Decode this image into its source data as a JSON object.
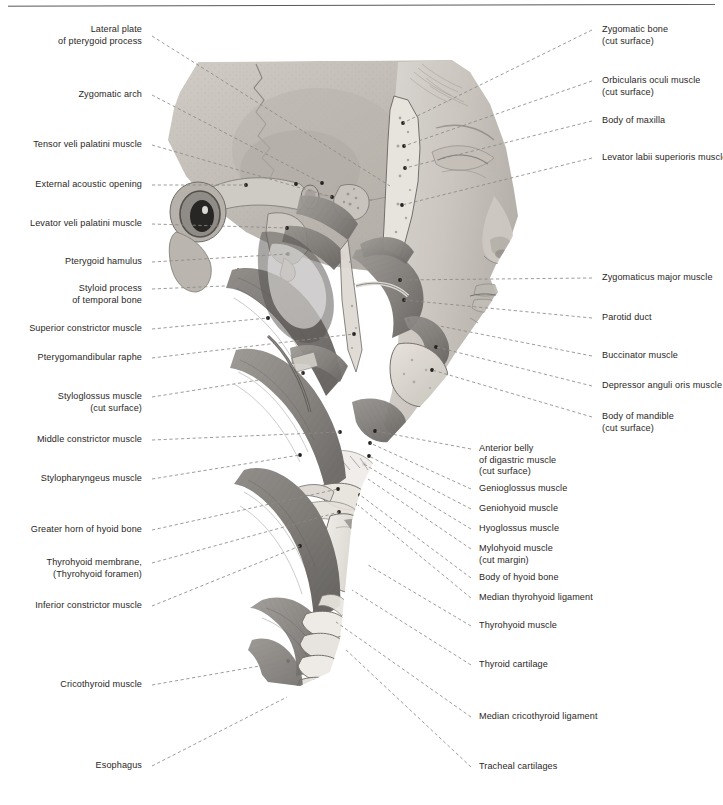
{
  "figure": {
    "style": "grayscale halftone anatomical illustration",
    "background_color": "#ffffff",
    "label_color": "#2b2726",
    "leader_color": "#8d8a87"
  },
  "labels_left": [
    {
      "id": "lateral-plate-of-pterygoid-process",
      "lines": [
        "Lateral plate",
        "of pterygoid process"
      ],
      "text_right_x": 142,
      "text_top_y": 24,
      "anchor_x": 152,
      "anchor_y": 36,
      "target_x": 390,
      "target_y": 186
    },
    {
      "id": "zygomatic-arch",
      "lines": [
        "Zygomatic arch"
      ],
      "text_right_x": 142,
      "text_top_y": 89,
      "anchor_x": 152,
      "anchor_y": 95,
      "target_x": 322,
      "target_y": 183
    },
    {
      "id": "tensor-veli-palatini-muscle",
      "lines": [
        "Tensor veli palatini muscle"
      ],
      "text_right_x": 142,
      "text_top_y": 139,
      "anchor_x": 152,
      "anchor_y": 145,
      "target_x": 332,
      "target_y": 197
    },
    {
      "id": "external-acoustic-opening",
      "lines": [
        "External acoustic opening"
      ],
      "text_right_x": 142,
      "text_top_y": 179,
      "anchor_x": 152,
      "anchor_y": 185,
      "target_x": 246,
      "target_y": 185
    },
    {
      "id": "levator-veli-palatini-muscle",
      "lines": [
        "Levator veli palatini muscle"
      ],
      "text_right_x": 142,
      "text_top_y": 218,
      "anchor_x": 152,
      "anchor_y": 224,
      "target_x": 287,
      "target_y": 228
    },
    {
      "id": "pterygoid-hamulus",
      "lines": [
        "Pterygoid hamulus"
      ],
      "text_right_x": 142,
      "text_top_y": 256,
      "anchor_x": 152,
      "anchor_y": 262,
      "target_x": 288,
      "target_y": 254
    },
    {
      "id": "styloid-process-of-temporal-bone",
      "lines": [
        "Styloid process",
        "of temporal bone"
      ],
      "text_right_x": 142,
      "text_top_y": 283,
      "anchor_x": 152,
      "anchor_y": 289,
      "target_x": 248,
      "target_y": 285
    },
    {
      "id": "superior-constrictor-muscle",
      "lines": [
        "Superior constrictor muscle"
      ],
      "text_right_x": 142,
      "text_top_y": 323,
      "anchor_x": 152,
      "anchor_y": 329,
      "target_x": 268,
      "target_y": 318
    },
    {
      "id": "pterygomandibular-raphe",
      "lines": [
        "Pterygomandibular raphe"
      ],
      "text_right_x": 142,
      "text_top_y": 352,
      "anchor_x": 152,
      "anchor_y": 358,
      "target_x": 354,
      "target_y": 334
    },
    {
      "id": "styloglossus-muscle",
      "lines": [
        "Styloglossus muscle",
        "(cut surface)"
      ],
      "text_right_x": 142,
      "text_top_y": 391,
      "anchor_x": 152,
      "anchor_y": 397,
      "target_x": 303,
      "target_y": 373
    },
    {
      "id": "middle-constrictor-muscle",
      "lines": [
        "Middle constrictor muscle"
      ],
      "text_right_x": 142,
      "text_top_y": 434,
      "anchor_x": 152,
      "anchor_y": 440,
      "target_x": 340,
      "target_y": 432
    },
    {
      "id": "stylopharyngeus-muscle",
      "lines": [
        "Stylopharyngeus muscle"
      ],
      "text_right_x": 142,
      "text_top_y": 473,
      "anchor_x": 152,
      "anchor_y": 479,
      "target_x": 300,
      "target_y": 455
    },
    {
      "id": "greater-horn-of-hyoid-bone",
      "lines": [
        "Greater horn of hyoid bone"
      ],
      "text_right_x": 142,
      "text_top_y": 524,
      "anchor_x": 152,
      "anchor_y": 530,
      "target_x": 338,
      "target_y": 489
    },
    {
      "id": "thyrohyoid-membrane-foramen",
      "lines": [
        "Thyrohyoid membrane,",
        "(Thyrohyoid foramen)"
      ],
      "text_right_x": 142,
      "text_top_y": 557,
      "anchor_x": 152,
      "anchor_y": 563,
      "target_x": 339,
      "target_y": 512
    },
    {
      "id": "inferior-constrictor-muscle",
      "lines": [
        "Inferior constrictor muscle"
      ],
      "text_right_x": 142,
      "text_top_y": 600,
      "anchor_x": 152,
      "anchor_y": 606,
      "target_x": 300,
      "target_y": 546
    },
    {
      "id": "cricothyroid-muscle",
      "lines": [
        "Cricothyroid muscle"
      ],
      "text_right_x": 142,
      "text_top_y": 679,
      "anchor_x": 152,
      "anchor_y": 685,
      "target_x": 288,
      "target_y": 661
    },
    {
      "id": "esophagus",
      "lines": [
        "Esophagus"
      ],
      "text_right_x": 142,
      "text_top_y": 760,
      "anchor_x": 152,
      "anchor_y": 766,
      "target_x": 287,
      "target_y": 697
    }
  ],
  "labels_right": [
    {
      "id": "zygomatic-bone",
      "lines": [
        "Zygomatic bone",
        "(cut surface)"
      ],
      "text_left_x": 602,
      "text_top_y": 24,
      "anchor_x": 592,
      "anchor_y": 30,
      "target_x": 403,
      "target_y": 123
    },
    {
      "id": "orbicularis-oculi-muscle",
      "lines": [
        "Orbicularis oculi muscle",
        "(cut surface)"
      ],
      "text_left_x": 602,
      "text_top_y": 75,
      "anchor_x": 592,
      "anchor_y": 81,
      "target_x": 404,
      "target_y": 146
    },
    {
      "id": "body-of-maxilla",
      "lines": [
        "Body of maxilla"
      ],
      "text_left_x": 602,
      "text_top_y": 115,
      "anchor_x": 592,
      "anchor_y": 121,
      "target_x": 405,
      "target_y": 168
    },
    {
      "id": "levator-labii-superioris-muscle",
      "lines": [
        "Levator labii superioris muscle"
      ],
      "text_left_x": 602,
      "text_top_y": 152,
      "anchor_x": 592,
      "anchor_y": 158,
      "target_x": 402,
      "target_y": 205
    },
    {
      "id": "zygomaticus-major-muscle",
      "lines": [
        "Zygomaticus major muscle"
      ],
      "text_left_x": 602,
      "text_top_y": 272,
      "anchor_x": 592,
      "anchor_y": 278,
      "target_x": 400,
      "target_y": 280
    },
    {
      "id": "parotid-duct",
      "lines": [
        "Parotid duct"
      ],
      "text_left_x": 602,
      "text_top_y": 312,
      "anchor_x": 592,
      "anchor_y": 318,
      "target_x": 404,
      "target_y": 300
    },
    {
      "id": "buccinator-muscle",
      "lines": [
        "Buccinator muscle"
      ],
      "text_left_x": 602,
      "text_top_y": 350,
      "anchor_x": 592,
      "anchor_y": 356,
      "target_x": 409,
      "target_y": 320
    },
    {
      "id": "depressor-anguli-oris-muscle",
      "lines": [
        "Depressor anguli oris muscle"
      ],
      "text_left_x": 602,
      "text_top_y": 380,
      "anchor_x": 592,
      "anchor_y": 386,
      "target_x": 436,
      "target_y": 347
    },
    {
      "id": "body-of-mandible",
      "lines": [
        "Body of mandible",
        "(cut surface)"
      ],
      "text_left_x": 602,
      "text_top_y": 411,
      "anchor_x": 592,
      "anchor_y": 417,
      "target_x": 432,
      "target_y": 370
    },
    {
      "id": "anterior-belly-of-digastric-muscle",
      "lines": [
        "Anterior belly",
        "of digastric muscle",
        "(cut surface)"
      ],
      "text_left_x": 479,
      "text_top_y": 443,
      "anchor_x": 471,
      "anchor_y": 449,
      "target_x": 375,
      "target_y": 431
    },
    {
      "id": "genioglossus-muscle",
      "lines": [
        "Genioglossus muscle"
      ],
      "text_left_x": 479,
      "text_top_y": 483,
      "anchor_x": 471,
      "anchor_y": 489,
      "target_x": 370,
      "target_y": 443
    },
    {
      "id": "geniohyoid-muscle",
      "lines": [
        "Geniohyoid muscle"
      ],
      "text_left_x": 479,
      "text_top_y": 503,
      "anchor_x": 471,
      "anchor_y": 509,
      "target_x": 369,
      "target_y": 456
    },
    {
      "id": "hyoglossus-muscle",
      "lines": [
        "Hyoglossus muscle"
      ],
      "text_left_x": 479,
      "text_top_y": 523,
      "anchor_x": 471,
      "anchor_y": 529,
      "target_x": 364,
      "target_y": 464
    },
    {
      "id": "mylohyoid-muscle",
      "lines": [
        "Mylohyoid muscle",
        "(cut margin)"
      ],
      "text_left_x": 479,
      "text_top_y": 543,
      "anchor_x": 471,
      "anchor_y": 549,
      "target_x": 368,
      "target_y": 479
    },
    {
      "id": "body-of-hyoid-bone",
      "lines": [
        "Body of hyoid bone"
      ],
      "text_left_x": 479,
      "text_top_y": 572,
      "anchor_x": 471,
      "anchor_y": 578,
      "target_x": 360,
      "target_y": 495
    },
    {
      "id": "median-thyrohyoid-ligament",
      "lines": [
        "Median thyrohyoid ligament"
      ],
      "text_left_x": 479,
      "text_top_y": 592,
      "anchor_x": 471,
      "anchor_y": 598,
      "target_x": 358,
      "target_y": 505
    },
    {
      "id": "thyrohyoid-muscle",
      "lines": [
        "Thyrohyoid muscle"
      ],
      "text_left_x": 479,
      "text_top_y": 620,
      "anchor_x": 471,
      "anchor_y": 626,
      "target_x": 368,
      "target_y": 565
    },
    {
      "id": "thyroid-cartilage",
      "lines": [
        "Thyroid cartilage"
      ],
      "text_left_x": 479,
      "text_top_y": 659,
      "anchor_x": 471,
      "anchor_y": 665,
      "target_x": 352,
      "target_y": 590
    },
    {
      "id": "median-cricothyroid-ligament",
      "lines": [
        "Median cricothyroid ligament"
      ],
      "text_left_x": 479,
      "text_top_y": 711,
      "anchor_x": 471,
      "anchor_y": 717,
      "target_x": 336,
      "target_y": 622
    },
    {
      "id": "tracheal-cartilages",
      "lines": [
        "Tracheal cartilages"
      ],
      "text_left_x": 479,
      "text_top_y": 761,
      "anchor_x": 471,
      "anchor_y": 767,
      "target_x": 344,
      "target_y": 648
    }
  ],
  "illustration": {
    "name": "head-and-neck-lateral-dissection",
    "bounding_box": {
      "x": 150,
      "y": 58,
      "width": 390,
      "height": 625
    },
    "regions": [
      "calvaria / temporal squama",
      "zygomatic arch (cut)",
      "external acoustic opening",
      "styloid process",
      "pterygoid process with hamulus",
      "superior constrictor muscle",
      "pterygomandibular raphe",
      "buccinator muscle",
      "middle constrictor muscle",
      "inferior constrictor muscle",
      "hyoid bone",
      "thyrohyoid membrane",
      "thyroid cartilage",
      "cricothyroid muscle",
      "tracheal cartilages",
      "esophagus",
      "nose, lips, chin profile"
    ]
  }
}
